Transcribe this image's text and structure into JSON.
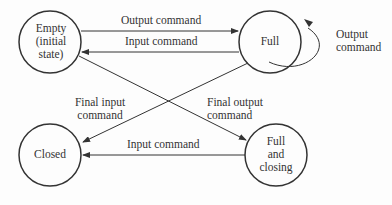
{
  "states": {
    "empty": {
      "line1": "Empty",
      "line2": "(initial",
      "line3": "state)"
    },
    "full": {
      "label": "Full"
    },
    "closed": {
      "label": "Closed"
    },
    "full_closing": {
      "line1": "Full",
      "line2": "and",
      "line3": "closing"
    }
  },
  "transitions": {
    "empty_to_full": "Output command",
    "full_to_empty": "Input command",
    "full_self_line1": "Output",
    "full_self_line2": "command",
    "full_to_closed_line1": "Final input",
    "full_to_closed_line2": "command",
    "empty_to_fullclosing_line1": "Final output",
    "empty_to_fullclosing_line2": "command",
    "fullclosing_to_closed": "Input command"
  }
}
